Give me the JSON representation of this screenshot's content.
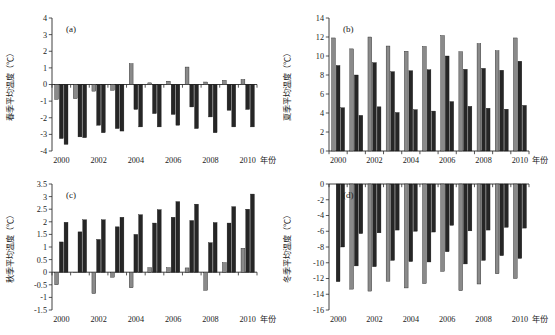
{
  "figure": {
    "background": "#ffffff",
    "series_colors": {
      "light": "#8a8a8a",
      "dark": "#262626"
    },
    "x_axis_unit": "年份"
  },
  "chart_data": [
    {
      "type": "bar",
      "panel": "(a)",
      "title": "",
      "xlabel": "年份",
      "ylabel": "春季平均温度（℃）",
      "ylim": [
        -4,
        4
      ],
      "yticks": [
        -4,
        -3,
        -2,
        -1,
        0,
        1,
        2,
        3,
        4
      ],
      "ytick_labels": [
        "-4",
        "-3",
        "-2",
        "-1",
        "0",
        "1",
        "2",
        "3",
        "4"
      ],
      "categories": [
        2000,
        2001,
        2002,
        2003,
        2004,
        2005,
        2006,
        2007,
        2008,
        2009,
        2010
      ],
      "xtick_labels": [
        "2000",
        "2002",
        "2004",
        "2006",
        "2008",
        "2010"
      ],
      "grid": false,
      "legend": "none",
      "series": [
        {
          "name": "浅色",
          "color": "#8a8a8a",
          "values": [
            -0.9,
            -0.85,
            -0.4,
            -0.35,
            1.25,
            0.1,
            0.2,
            1.05,
            0.15,
            0.25,
            0.3
          ]
        },
        {
          "name": "深色1",
          "color": "#262626",
          "values": [
            -3.25,
            -3.15,
            -2.45,
            -2.65,
            -1.5,
            -1.75,
            -1.8,
            -1.35,
            -1.95,
            -1.55,
            -1.5
          ]
        },
        {
          "name": "深色2",
          "color": "#262626",
          "values": [
            -3.6,
            -3.2,
            -2.9,
            -2.8,
            -2.55,
            -2.55,
            -2.45,
            -2.65,
            -2.9,
            -2.55,
            -2.55
          ]
        }
      ]
    },
    {
      "type": "bar",
      "panel": "(b)",
      "title": "",
      "xlabel": "年份",
      "ylabel": "夏季平均温度（℃）",
      "ylim": [
        0,
        14
      ],
      "yticks": [
        0,
        2,
        4,
        6,
        8,
        10,
        12,
        14
      ],
      "ytick_labels": [
        "0",
        "2",
        "4",
        "6",
        "8",
        "10",
        "12",
        "14"
      ],
      "categories": [
        2000,
        2001,
        2002,
        2003,
        2004,
        2005,
        2006,
        2007,
        2008,
        2009,
        2010
      ],
      "xtick_labels": [
        "2000",
        "2002",
        "2004",
        "2006",
        "2008",
        "2010"
      ],
      "grid": false,
      "legend": "none",
      "series": [
        {
          "name": "浅色",
          "color": "#8a8a8a",
          "values": [
            11.9,
            10.75,
            12.0,
            11.05,
            10.5,
            11.0,
            12.15,
            10.45,
            11.3,
            10.55,
            11.9
          ]
        },
        {
          "name": "深色1",
          "color": "#262626",
          "values": [
            9.0,
            8.0,
            9.3,
            8.35,
            8.45,
            8.55,
            10.0,
            8.6,
            8.7,
            8.5,
            9.45
          ]
        },
        {
          "name": "深色2",
          "color": "#262626",
          "values": [
            4.55,
            3.75,
            4.65,
            4.05,
            4.35,
            4.2,
            5.2,
            4.7,
            4.5,
            4.4,
            4.8
          ]
        }
      ]
    },
    {
      "type": "bar",
      "panel": "(c)",
      "title": "",
      "xlabel": "年份",
      "ylabel": "秋季平均温度（℃）",
      "ylim": [
        -1.5,
        3.5
      ],
      "yticks": [
        -1.5,
        -1,
        -0.5,
        0,
        0.5,
        1,
        1.5,
        2,
        2.5,
        3,
        3.5
      ],
      "ytick_labels": [
        "-1.5",
        "-1",
        "-0.5",
        "0",
        "0.5",
        "1",
        "1.5",
        "2",
        "2.5",
        "3",
        "3.5"
      ],
      "categories": [
        2000,
        2001,
        2002,
        2003,
        2004,
        2005,
        2006,
        2007,
        2008,
        2009,
        2010
      ],
      "xtick_labels": [
        "2000",
        "2002",
        "2004",
        "2006",
        "2008",
        "2010"
      ],
      "grid": false,
      "legend": "none",
      "series": [
        {
          "name": "浅色",
          "color": "#8a8a8a",
          "values": [
            -0.5,
            0.0,
            -0.85,
            -0.2,
            -0.62,
            0.18,
            0.18,
            0.17,
            -0.72,
            0.38,
            0.95
          ]
        },
        {
          "name": "深色1",
          "color": "#262626",
          "values": [
            1.2,
            1.6,
            1.3,
            1.8,
            1.5,
            1.95,
            2.18,
            2.05,
            1.17,
            1.95,
            2.5
          ]
        },
        {
          "name": "深色2",
          "color": "#262626",
          "values": [
            1.98,
            2.08,
            2.08,
            2.18,
            2.28,
            2.48,
            2.8,
            2.7,
            1.97,
            2.6,
            3.1
          ]
        }
      ]
    },
    {
      "type": "bar",
      "panel": "(d)",
      "title": "",
      "xlabel": "年份",
      "ylabel": "冬季平均温度（℃）",
      "ylim": [
        -16,
        0
      ],
      "yticks": [
        -16,
        -14,
        -12,
        -10,
        -8,
        -6,
        -4,
        -2,
        0
      ],
      "ytick_labels": [
        "-16",
        "-14",
        "-12",
        "-10",
        "-8",
        "-6",
        "-4",
        "-2",
        "0"
      ],
      "categories": [
        2000,
        2001,
        2002,
        2003,
        2004,
        2005,
        2006,
        2007,
        2008,
        2009,
        2010
      ],
      "xtick_labels": [
        "2000",
        "2002",
        "2004",
        "2006",
        "2008",
        "2010"
      ],
      "grid": false,
      "legend": "none",
      "series": [
        {
          "name": "浅色",
          "color": "#8a8a8a",
          "values": [
            null,
            -13.35,
            -13.6,
            -12.35,
            -13.2,
            -12.65,
            -11.1,
            -13.55,
            -12.7,
            -11.4,
            -12.0
          ]
        },
        {
          "name": "深色1",
          "color": "#262626",
          "values": [
            -12.4,
            -10.4,
            -10.5,
            -9.7,
            -9.85,
            -9.9,
            -8.6,
            -10.15,
            -9.7,
            -9.1,
            -9.45
          ]
        },
        {
          "name": "深色2",
          "color": "#262626",
          "values": [
            -8.0,
            -6.3,
            -6.2,
            -5.85,
            -6.0,
            -6.1,
            -5.25,
            -5.95,
            -5.85,
            -5.5,
            -5.6
          ]
        }
      ]
    }
  ]
}
